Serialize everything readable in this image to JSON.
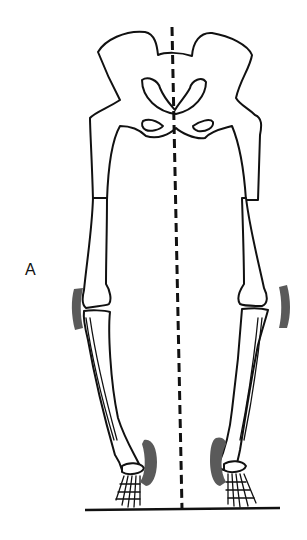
{
  "figure": {
    "panel_label": "A",
    "elements": {
      "pelvis": "pelvis-outline",
      "midline": "dashed vertical midline",
      "ground": "ground line",
      "pressure_zones": [
        "left-knee-lateral",
        "right-knee-lateral",
        "left-ankle-medial",
        "right-ankle-medial"
      ]
    },
    "colors": {
      "line": "#111111",
      "pressure_zone": "#5a5a5a",
      "background": "#ffffff"
    }
  }
}
